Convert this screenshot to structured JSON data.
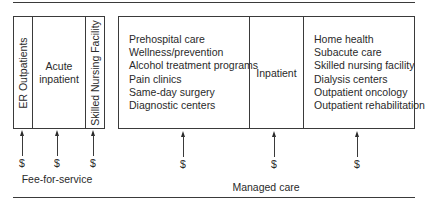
{
  "diagram": {
    "fee_for_service": {
      "label": "Fee-for-service",
      "cells": [
        {
          "label": "ER Outpatients",
          "orientation": "vertical"
        },
        {
          "label": "Acute\ninpatient",
          "lines": [
            "Acute",
            "inpatient"
          ],
          "orientation": "horizontal"
        },
        {
          "label": "Skilled Nursing Facility",
          "orientation": "vertical"
        }
      ],
      "payment_symbol": "$"
    },
    "managed_care": {
      "label": "Managed care",
      "cells": [
        {
          "items": [
            "Prehospital care",
            "Wellness/prevention",
            "Alcohol treatment programs",
            "Pain clinics",
            "Same-day surgery",
            "Diagnostic centers"
          ]
        },
        {
          "label": "Inpatient"
        },
        {
          "items": [
            "Home health",
            "Subacute care",
            "Skilled nursing facility",
            "Dialysis centers",
            "Outpatient oncology",
            "Outpatient rehabilitation"
          ]
        }
      ],
      "payment_symbol": "$"
    },
    "colors": {
      "line": "#3a3a3a",
      "text": "#2a2a2a",
      "background": "#ffffff"
    }
  }
}
